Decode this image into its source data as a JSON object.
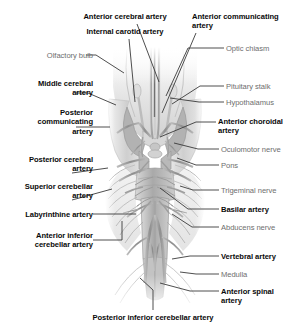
{
  "figure": {
    "style": {
      "bold_color": "#0a0a0a",
      "plain_color": "#6e6e6e",
      "leader_color": "#3a3a3a",
      "background": "#ffffff",
      "illustration_tone": "#b9b9b9"
    },
    "labels": [
      {
        "id": "anterior-cerebral-artery",
        "text": "Anterior cerebral artery",
        "weight": "bold",
        "align": "center",
        "x": 62,
        "y": 12,
        "w": 126
      },
      {
        "id": "internal-carotid-artery",
        "text": "Internal carotid artery",
        "weight": "bold",
        "align": "center",
        "x": 62,
        "y": 27,
        "w": 126
      },
      {
        "id": "anterior-communicating-artery",
        "text": "Anterior communicating\nartery",
        "weight": "bold",
        "align": "left",
        "x": 192,
        "y": 12,
        "w": 112
      },
      {
        "id": "optic-chiasm",
        "text": "Optic chiasm",
        "weight": "plain",
        "align": "left",
        "x": 226,
        "y": 44,
        "w": 78
      },
      {
        "id": "olfactory-bulb",
        "text": "Olfactory bulb",
        "weight": "plain",
        "align": "right",
        "x": 8,
        "y": 51,
        "w": 85
      },
      {
        "id": "pituitary-stalk",
        "text": "Pituitary stalk",
        "weight": "plain",
        "align": "left",
        "x": 226,
        "y": 82,
        "w": 78
      },
      {
        "id": "middle-cerebral-artery",
        "text": "Middle cerebral\nartery",
        "weight": "bold",
        "align": "right",
        "x": 5,
        "y": 79,
        "w": 88
      },
      {
        "id": "hypothalamus",
        "text": "Hypothalamus",
        "weight": "plain",
        "align": "left",
        "x": 226,
        "y": 98,
        "w": 78
      },
      {
        "id": "anterior-choroidal-artery",
        "text": "Anterior choroidal\nartery",
        "weight": "bold",
        "align": "left",
        "x": 218,
        "y": 117,
        "w": 86
      },
      {
        "id": "posterior-communicating-artery",
        "text": "Posterior\ncommunicating\nartery",
        "weight": "bold",
        "align": "right",
        "x": 5,
        "y": 108,
        "w": 88
      },
      {
        "id": "oculomotor-nerve",
        "text": "Oculomotor nerve",
        "weight": "plain",
        "align": "left",
        "x": 221,
        "y": 145,
        "w": 82
      },
      {
        "id": "pons",
        "text": "Pons",
        "weight": "plain",
        "align": "left",
        "x": 221,
        "y": 161,
        "w": 82
      },
      {
        "id": "posterior-cerebral-artery",
        "text": "Posterior cerebral\nartery",
        "weight": "bold",
        "align": "right",
        "x": 2,
        "y": 155,
        "w": 91
      },
      {
        "id": "superior-cerebellar-artery",
        "text": "Superior cerebellar\nartery",
        "weight": "bold",
        "align": "right",
        "x": 2,
        "y": 182,
        "w": 91
      },
      {
        "id": "trigeminal-nerve",
        "text": "Trigeminal nerve",
        "weight": "plain",
        "align": "left",
        "x": 221,
        "y": 186,
        "w": 82
      },
      {
        "id": "basilar-artery",
        "text": "Basilar artery",
        "weight": "bold",
        "align": "left",
        "x": 221,
        "y": 205,
        "w": 82
      },
      {
        "id": "labyrinthine-artery",
        "text": "Labyrinthine artery",
        "weight": "bold",
        "align": "right",
        "x": 2,
        "y": 210,
        "w": 91
      },
      {
        "id": "abducens-nerve",
        "text": "Abducens nerve",
        "weight": "plain",
        "align": "left",
        "x": 221,
        "y": 223,
        "w": 82
      },
      {
        "id": "anterior-inferior-cerebellar-artery",
        "text": "Anterior inferior\ncerebellar artery",
        "weight": "bold",
        "align": "right",
        "x": 2,
        "y": 231,
        "w": 91
      },
      {
        "id": "vertebral-artery",
        "text": "Vertebral artery",
        "weight": "bold",
        "align": "left",
        "x": 221,
        "y": 252,
        "w": 82
      },
      {
        "id": "medulla",
        "text": "Medulla",
        "weight": "plain",
        "align": "left",
        "x": 221,
        "y": 270,
        "w": 82
      },
      {
        "id": "anterior-spinal-artery",
        "text": "Anterior spinal\nartery",
        "weight": "bold",
        "align": "left",
        "x": 221,
        "y": 287,
        "w": 82
      },
      {
        "id": "posterior-inferior-cerebellar-artery",
        "text": "Posterior inferior cerebellar artery",
        "weight": "bold",
        "align": "center",
        "x": 58,
        "y": 313,
        "w": 190
      }
    ],
    "leaders": [
      {
        "id": "leader-anterior-cerebral-artery",
        "points": "137,24 159,82"
      },
      {
        "id": "leader-internal-carotid-artery",
        "points": "129,39 135,102"
      },
      {
        "id": "leader-anterior-communicating-artery",
        "points": "196,33 162,113"
      },
      {
        "id": "leader-optic-chiasm",
        "points": "224,48 188,48 166,96"
      },
      {
        "id": "leader-olfactory-bulb",
        "points": "86,55 96,55 124,73"
      },
      {
        "id": "leader-pituitary-stalk",
        "points": "224,86 200,86 172,104"
      },
      {
        "id": "leader-middle-cerebral-artery",
        "points": "76,93 88,93 116,105"
      },
      {
        "id": "leader-hypothalamus",
        "points": "224,102 199,102 170,98"
      },
      {
        "id": "leader-anterior-choroidal-artery",
        "points": "216,122 196,122 160,137"
      },
      {
        "id": "leader-posterior-communicating-artery",
        "points": "76,127 110,127"
      },
      {
        "id": "leader-oculomotor-nerve",
        "points": "219,149 198,149 174,143"
      },
      {
        "id": "leader-pons",
        "points": "219,165 196,165 177,158"
      },
      {
        "id": "leader-posterior-cerebral-artery",
        "points": "72,173 108,168"
      },
      {
        "id": "leader-superior-cerebellar-artery",
        "points": "72,200 112,189"
      },
      {
        "id": "leader-trigeminal-nerve",
        "points": "219,190 193,190 180,186"
      },
      {
        "id": "leader-basilar-artery",
        "points": "219,209 188,209 160,188"
      },
      {
        "id": "leader-labyrinthine-artery",
        "points": "93,214 136,214"
      },
      {
        "id": "leader-abducens-nerve",
        "points": "219,227 192,227 172,214"
      },
      {
        "id": "leader-anterior-inferior-cerebellar-artery",
        "points": "93,240 122,240 122,221"
      },
      {
        "id": "leader-vertebral-artery",
        "points": "219,256 190,256 172,259"
      },
      {
        "id": "leader-medulla",
        "points": "219,274 196,274 180,272"
      },
      {
        "id": "leader-anterior-spinal-artery",
        "points": "219,291 190,291 160,283"
      },
      {
        "id": "leader-posterior-inferior-cerebellar-artery",
        "points": "153,310 153,290 140,278"
      }
    ]
  }
}
